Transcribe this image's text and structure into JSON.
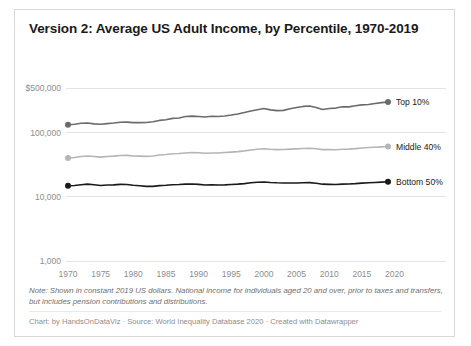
{
  "title": "Version 2: Average US Adult Income, by Percentile, 1970-2019",
  "note": "Note: Shown in constant 2019 US dollars. National income for individuals aged 20 and over, prior to taxes and transfers, but includes pension contributions and distributions.",
  "credit": "Chart: by HandsOnDataViz · Source: World Inequality Database 2020 · Created with Datawrapper",
  "colors": {
    "top10": "#6b6b6b",
    "middle40": "#b5b5b5",
    "bottom50": "#1a1a1a",
    "grid": "#e3e3e3",
    "axis_text": "#8d8d8d",
    "title_text": "#1a1a1a",
    "note_text": "#6f6f6f",
    "card_border": "#d8d8d8"
  },
  "chart_data": {
    "type": "line",
    "title": "Version 2: Average US Adult Income, by Percentile, 1970-2019",
    "xlabel": "",
    "ylabel": "",
    "yscale": "log",
    "ylim": [
      1000,
      500000
    ],
    "xlim": [
      1970,
      2019
    ],
    "grid": true,
    "legend_position": "right-of-line-ends",
    "ytick_labels": [
      "$500,000",
      "100,000",
      "10,000",
      "1,000"
    ],
    "ytick_values": [
      500000,
      100000,
      10000,
      1000
    ],
    "xtick_labels": [
      "1970",
      "1975",
      "1980",
      "1985",
      "1990",
      "1995",
      "2000",
      "2005",
      "2010",
      "2015",
      "2020"
    ],
    "xtick_values": [
      1970,
      1975,
      1980,
      1985,
      1990,
      1995,
      2000,
      2005,
      2010,
      2015,
      2020
    ],
    "x": [
      1970,
      1971,
      1972,
      1973,
      1974,
      1975,
      1976,
      1977,
      1978,
      1979,
      1980,
      1981,
      1982,
      1983,
      1984,
      1985,
      1986,
      1987,
      1988,
      1989,
      1990,
      1991,
      1992,
      1993,
      1994,
      1995,
      1996,
      1997,
      1998,
      1999,
      2000,
      2001,
      2002,
      2003,
      2004,
      2005,
      2006,
      2007,
      2008,
      2009,
      2010,
      2011,
      2012,
      2013,
      2014,
      2015,
      2016,
      2017,
      2018,
      2019
    ],
    "series": [
      {
        "name": "Top 10%",
        "color": "#6b6b6b",
        "end_label": "Top 10%",
        "values": [
          134000,
          136000,
          141000,
          142000,
          138000,
          136000,
          139000,
          142000,
          146000,
          147000,
          144000,
          144000,
          145000,
          149000,
          156000,
          160000,
          168000,
          170000,
          180000,
          182000,
          180000,
          176000,
          181000,
          180000,
          183000,
          189000,
          197000,
          207000,
          219000,
          229000,
          239000,
          228000,
          222000,
          224000,
          237000,
          248000,
          258000,
          262000,
          248000,
          231000,
          240000,
          243000,
          255000,
          254000,
          264000,
          273000,
          276000,
          286000,
          296000,
          302000
        ]
      },
      {
        "name": "Middle 40%",
        "color": "#b5b5b5",
        "end_label": "Middle 40%",
        "values": [
          40500,
          41200,
          42600,
          43400,
          42600,
          41800,
          42600,
          43200,
          44300,
          44400,
          43500,
          43300,
          42900,
          43400,
          45000,
          45800,
          47000,
          47600,
          48500,
          49200,
          48800,
          47900,
          48500,
          48400,
          49200,
          50000,
          50900,
          52200,
          54000,
          55400,
          56400,
          55300,
          54700,
          54900,
          55600,
          56200,
          57000,
          57500,
          56300,
          54600,
          54600,
          54500,
          55300,
          55600,
          56600,
          58000,
          58900,
          59600,
          60300,
          61000
        ]
      },
      {
        "name": "Bottom 50%",
        "color": "#1a1a1a",
        "end_label": "Bottom 50%",
        "values": [
          14900,
          15100,
          15500,
          15800,
          15500,
          15100,
          15300,
          15400,
          15700,
          15600,
          15200,
          14900,
          14600,
          14600,
          15000,
          15200,
          15500,
          15600,
          15800,
          15900,
          15700,
          15300,
          15400,
          15300,
          15400,
          15600,
          15800,
          16100,
          16600,
          16900,
          17100,
          16800,
          16600,
          16500,
          16500,
          16500,
          16600,
          16700,
          16300,
          15800,
          15700,
          15600,
          15800,
          15900,
          16100,
          16400,
          16600,
          16800,
          17000,
          17200
        ]
      }
    ]
  }
}
